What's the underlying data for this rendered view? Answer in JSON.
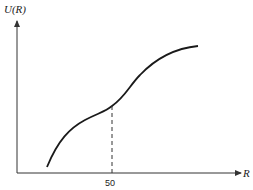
{
  "figure": {
    "y_axis_label": "U(R)",
    "x_axis_label": "R",
    "x_tick_label": "50",
    "curve_color": "#1a1a1a",
    "axis_color": "#333333"
  }
}
